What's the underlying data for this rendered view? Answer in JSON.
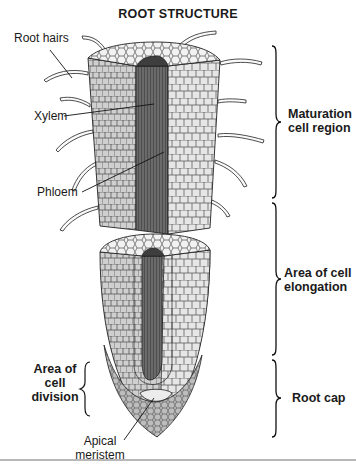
{
  "title": "ROOT STRUCTURE",
  "left_labels": {
    "root_hairs": "Root hairs",
    "xylem": "Xylem",
    "phloem": "Phloem",
    "area_of_cell_division": [
      "Area of",
      "cell",
      "division"
    ],
    "apical_meristem": [
      "Apical",
      "meristem"
    ]
  },
  "right_labels": {
    "maturation": [
      "Maturation",
      "cell region"
    ],
    "elongation": [
      "Area of cell",
      "elongation"
    ],
    "root_cap": "Root cap"
  },
  "colors": {
    "outline": "#1a1a1a",
    "cell_fill": "#e8e8e8",
    "cell_shade": "#c9c9c9",
    "vascular_dark": "#5a5a5a",
    "background": "#ffffff"
  }
}
